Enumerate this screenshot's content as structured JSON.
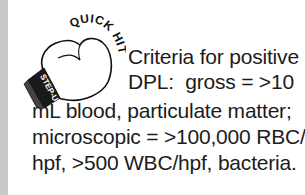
{
  "callout": {
    "badge": {
      "arc_text": "QUICK HIT",
      "cuff_text": "STEP-UP",
      "icon": "boxing-glove-icon"
    },
    "text_lines": [
      "Criteria for positive",
      "DPL:  gross = >10",
      "mL blood, particulate matter;",
      "microscopic = >100,000 RBC/",
      "hpf, >500 WBC/hpf, bacteria."
    ]
  },
  "colors": {
    "side_bar": "#c9c9c9",
    "text": "#1c1c1c",
    "glove_outline": "#111111",
    "cuff": "#1a1a1a"
  }
}
